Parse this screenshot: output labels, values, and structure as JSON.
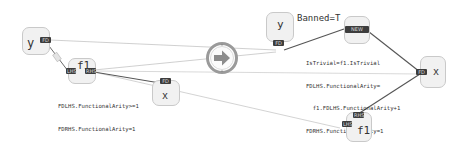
{
  "diagram": {
    "type": "graph-rewrite-rule",
    "center_symbol": "arrow-right-icon",
    "lhs": {
      "nodes": [
        {
          "id": "lhs_y",
          "label": "y",
          "ports": [
            "FD"
          ]
        },
        {
          "id": "lhs_f1",
          "label": "f1",
          "ports": [
            "LHS",
            "RHS"
          ]
        },
        {
          "id": "lhs_x",
          "label": "x",
          "ports": [
            "FD"
          ]
        }
      ],
      "edge_label": "FD",
      "annotation_lines": [
        "FDLHS.FunctionalArity>=1",
        "FDRHS.FunctionalArity=1"
      ]
    },
    "rhs": {
      "nodes": [
        {
          "id": "rhs_y",
          "label": "y",
          "ports": [
            "FD"
          ]
        },
        {
          "id": "rhs_new",
          "label": "",
          "ports": [
            "NEW"
          ]
        },
        {
          "id": "rhs_x",
          "label": "x",
          "ports": [
            "FD"
          ]
        },
        {
          "id": "rhs_f1",
          "label": "f1",
          "ports": [
            "RHS",
            "LHS"
          ]
        }
      ],
      "banned_annotation": "Banned=T",
      "annotation_lines": [
        "IsTrivial=f1.IsTrivial",
        "FDLHS.FunctionalArity=",
        "  f1.FDLHS.FunctionalArity+1",
        "FDRHS.FunctionalArity=1"
      ]
    }
  },
  "colors": {
    "node_fill": "#f1f1f1",
    "node_border": "#c9c9c9",
    "port_fill": "#3d3d3d",
    "edge_dark": "#555555",
    "edge_light": "#bdbdbd",
    "arrow_ring": "#9a9a9a",
    "arrow_fill": "#8c8c8c"
  }
}
